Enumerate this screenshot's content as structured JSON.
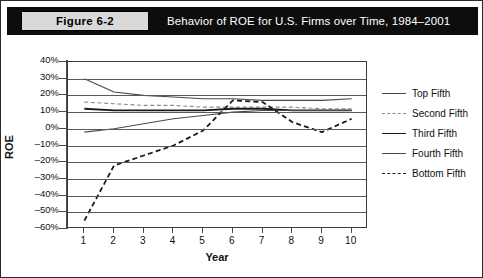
{
  "figure": {
    "tag": "Figure 6-2",
    "title": "Behavior of ROE for U.S. Firms over Time, 1984–2001"
  },
  "chart_data": {
    "type": "line",
    "title": "Behavior of ROE for U.S. Firms over Time, 1984–2001",
    "xlabel": "Year",
    "ylabel": "ROE",
    "x": [
      1,
      2,
      3,
      4,
      5,
      6,
      7,
      8,
      9,
      10
    ],
    "categories": [
      "1",
      "2",
      "3",
      "4",
      "5",
      "6",
      "7",
      "8",
      "9",
      "10"
    ],
    "xtick_labels": [
      "1",
      "2",
      "3",
      "4",
      "5",
      "6",
      "7",
      "8",
      "9",
      "10"
    ],
    "ytick_labels": [
      "40%",
      "30%",
      "20%",
      "10%",
      "0%",
      "–10%",
      "–20%",
      "–30%",
      "–40%",
      "–50%",
      "–60%"
    ],
    "ytick_values": [
      40,
      30,
      20,
      10,
      0,
      -10,
      -20,
      -30,
      -40,
      -50,
      -60
    ],
    "ylim": [
      -60,
      40
    ],
    "xlim": [
      0.45,
      10.55
    ],
    "grid": "horizontal",
    "legend_position": "right",
    "series": [
      {
        "name": "Top Fifth",
        "style": "solid",
        "width": 1.1,
        "color": "#4a4a4a",
        "values": [
          30,
          22,
          20,
          19,
          18,
          18,
          17,
          17,
          17,
          18
        ]
      },
      {
        "name": "Second Fifth",
        "style": "dashed-fine",
        "width": 1.1,
        "color": "#8a8a8a",
        "values": [
          16,
          15,
          14,
          14,
          13,
          13,
          13,
          13,
          12,
          12
        ]
      },
      {
        "name": "Third Fifth",
        "style": "solid-bold",
        "width": 1.8,
        "color": "#1a1a1a",
        "values": [
          12,
          11,
          11,
          11,
          11,
          12,
          12,
          11,
          11,
          11
        ]
      },
      {
        "name": "Fourth Fifth",
        "style": "solid",
        "width": 1.1,
        "color": "#4a4a4a",
        "values": [
          -2,
          0,
          3,
          6,
          8,
          10,
          11,
          11,
          11,
          11
        ]
      },
      {
        "name": "Bottom Fifth",
        "style": "dashed-bold",
        "width": 1.8,
        "color": "#1a1a1a",
        "values": [
          -55,
          -22,
          -16,
          -10,
          -1,
          17,
          16,
          4,
          -2,
          6
        ]
      }
    ]
  },
  "legend": {
    "items": [
      {
        "label": "Top Fifth"
      },
      {
        "label": "Second Fifth"
      },
      {
        "label": "Third Fifth"
      },
      {
        "label": "Fourth Fifth"
      },
      {
        "label": "Bottom Fifth"
      }
    ]
  },
  "colors": {
    "header_band": "#0d0d0d",
    "tag_fill": "#d9d9d9",
    "grid": "#5a5a5a",
    "axis": "#4a4a4a"
  }
}
